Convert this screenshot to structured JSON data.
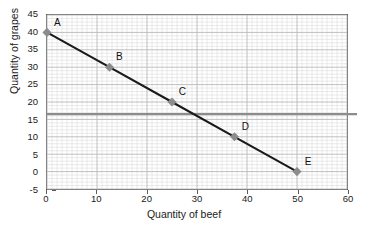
{
  "chart_data": {
    "type": "line",
    "title": "",
    "xlabel": "Quantity of beef",
    "ylabel": "Quantity of grapes",
    "xlim": [
      0,
      60
    ],
    "ylim": [
      -5,
      45
    ],
    "xticks": [
      0,
      10,
      20,
      30,
      40,
      50,
      60
    ],
    "yticks": [
      -5,
      0,
      5,
      10,
      15,
      20,
      25,
      30,
      35,
      40,
      45
    ],
    "xtick_labels": [
      "0",
      "10",
      "20",
      "30",
      "40",
      "50",
      "60"
    ],
    "ytick_labels": [
      "-5",
      "0",
      "5",
      "10",
      "15",
      "20",
      "25",
      "30",
      "35",
      "40",
      "45"
    ],
    "grid": true,
    "grid_minor": true,
    "legend": "none",
    "series": [
      {
        "name": "budget-line",
        "type": "line",
        "color": "#1a1a1a",
        "x": [
          0,
          12.5,
          25,
          37.5,
          50
        ],
        "values": [
          40,
          30,
          20,
          10,
          0
        ],
        "point_labels": [
          "A",
          "B",
          "C",
          "D",
          "E"
        ],
        "marker": "diamond",
        "marker_color": "#8c8c8c"
      },
      {
        "name": "horizontal-reference-line",
        "type": "hline",
        "color": "#8c8c8c",
        "y": 16.5,
        "x_start": 0,
        "x_end": 62
      }
    ],
    "points": [
      {
        "label": "A",
        "x": 0,
        "y": 40
      },
      {
        "label": "B",
        "x": 12.5,
        "y": 30
      },
      {
        "label": "C",
        "x": 25,
        "y": 20
      },
      {
        "label": "D",
        "x": 37.5,
        "y": 10
      },
      {
        "label": "E",
        "x": 50,
        "y": 0
      }
    ],
    "colors": {
      "line": "#1a1a1a",
      "marker": "#8c8c8c",
      "reference_line": "#8c8c8c",
      "axis": "#5a5a5a",
      "grid_major": "#b8b8b8",
      "grid_minor": "#dcdcdc",
      "text": "#1a1a1a",
      "background": "#ffffff"
    }
  }
}
